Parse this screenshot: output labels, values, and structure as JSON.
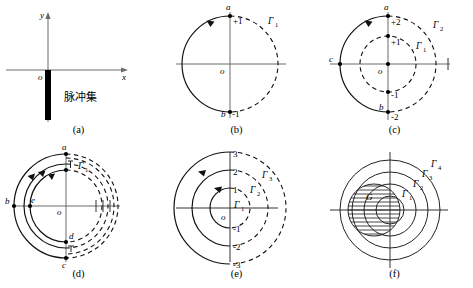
{
  "figure": {
    "title": "",
    "panel_count": 6,
    "panels": [
      {
        "id": "a",
        "caption": "(a)",
        "kind": "axes-with-pulse-bar",
        "axis_labels": {
          "x": "x",
          "y": "y",
          "origin": "o"
        },
        "annotation": "脉冲集",
        "description": "Cartesian axes with a thick vertical black bar descending from the origin along the negative y direction, labelled 脉冲集 (pulse set)."
      },
      {
        "id": "b",
        "caption": "(b)",
        "kind": "single-circle",
        "axis_labels": {
          "origin": "o"
        },
        "curves": [
          {
            "name": "Γ",
            "subscript": "1",
            "label": "Γ₁"
          }
        ],
        "points": [
          {
            "name": "a",
            "value": "+1",
            "position": "top"
          },
          {
            "name": "b",
            "value": "-1",
            "position": "bottom"
          }
        ],
        "arrow_direction": "counterclockwise",
        "description": "Circle with solid left half traversed counter-clockwise and dashed right half labelled Γ₁."
      },
      {
        "id": "c",
        "caption": "(c)",
        "kind": "two-circles",
        "axis_labels": {
          "origin": "o"
        },
        "curves": [
          {
            "name": "Γ",
            "subscript": "1",
            "label": "Γ₁"
          },
          {
            "name": "Γ",
            "subscript": "2",
            "label": "Γ₂"
          }
        ],
        "points": [
          {
            "name": "a",
            "value": "+2",
            "position": "top-outer"
          },
          {
            "name": "",
            "value": "+1",
            "position": "top-inner"
          },
          {
            "name": "",
            "value": "-1",
            "position": "bottom-inner"
          },
          {
            "name": "b",
            "value": "-2",
            "position": "bottom-outer"
          },
          {
            "name": "c",
            "value": "",
            "position": "left-outer"
          }
        ],
        "arrow_direction": "counterclockwise",
        "description": "Inner dashed circle Γ₁ through ±1 and outer circle Γ₂ through ±2 with solid left arc a→c→b."
      },
      {
        "id": "d",
        "caption": "(d)",
        "kind": "many-nested-circles",
        "axis_labels": {
          "origin": "o"
        },
        "curves": [
          {
            "name": "Γ",
            "subscript": "1",
            "label": "Γ₁"
          }
        ],
        "points": [
          {
            "name": "a",
            "value": "",
            "position": "top-outer"
          },
          {
            "name": "b",
            "value": "",
            "position": "left-outer"
          },
          {
            "name": "c",
            "value": "",
            "position": "bottom-outer"
          },
          {
            "name": "d",
            "value": "",
            "position": "bottom-inner"
          },
          {
            "name": "e",
            "value": "",
            "position": "left-inner"
          }
        ],
        "arrow_direction": "counterclockwise",
        "description": "Several closely nested circles accumulating; solid left arcs with arrows, dashed right arcs, tick marks on the positive x-axis."
      },
      {
        "id": "e",
        "caption": "(e)",
        "kind": "three-nested-circles",
        "axis_labels": {
          "origin": "o"
        },
        "curves": [
          {
            "name": "Γ",
            "subscript": "1",
            "label": "Γ₁"
          },
          {
            "name": "Γ",
            "subscript": "2",
            "label": "Γ₂"
          },
          {
            "name": "Γ",
            "subscript": "3",
            "label": "Γ₃"
          }
        ],
        "points": [
          {
            "name": "",
            "value": "1",
            "position": "top-inner"
          },
          {
            "name": "",
            "value": "2",
            "position": "top-middle"
          },
          {
            "name": "",
            "value": "3",
            "position": "top-outer"
          },
          {
            "name": "",
            "value": "-1",
            "position": "bottom-inner"
          },
          {
            "name": "",
            "value": "-2",
            "position": "bottom-middle"
          },
          {
            "name": "",
            "value": "-3",
            "position": "bottom-outer"
          }
        ],
        "arrow_direction": "counterclockwise",
        "description": "Three concentric circles of radii 1, 2, 3; solid left halves with arrows, dashed right halves labelled Γ₁, Γ₂, Γ₃."
      },
      {
        "id": "f",
        "caption": "(f)",
        "kind": "nested-circles-filled",
        "axis_labels": {},
        "curves": [
          {
            "name": "Γ",
            "subscript": "1",
            "label": "Γ₁"
          },
          {
            "name": "Γ",
            "subscript": "2",
            "label": "Γ₂"
          },
          {
            "name": "Γ",
            "subscript": "3",
            "label": "Γ₃"
          },
          {
            "name": "Γ",
            "subscript": "4",
            "label": "Γ₄"
          }
        ],
        "region_label": "G",
        "description": "Four full concentric solid circles Γ₁..Γ₄ with a hatched region G shifted left of centre."
      }
    ]
  },
  "colors": {
    "ink": "#111111",
    "axis": "#6a6a6a",
    "background": "#ffffff"
  }
}
